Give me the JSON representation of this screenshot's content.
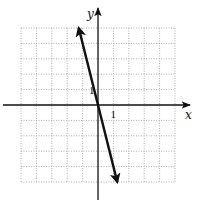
{
  "chart_data": {
    "type": "line",
    "title": "",
    "xlabel": "x",
    "ylabel": "y",
    "xlim": [
      -5,
      5
    ],
    "ylim": [
      -5,
      5
    ],
    "grid": true,
    "grid_step": 1,
    "tick_labels": [
      {
        "axis": "x",
        "value": 1,
        "text": "1"
      },
      {
        "axis": "y",
        "value": 1,
        "text": "1"
      }
    ],
    "series": [
      {
        "name": "y = -4x",
        "arrows": "both",
        "points": [
          {
            "x": -1.25,
            "y": 5
          },
          {
            "x": 1.25,
            "y": -5
          }
        ]
      }
    ]
  }
}
